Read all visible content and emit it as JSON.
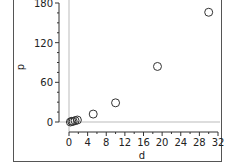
{
  "chart_data": {
    "type": "scatter",
    "title": "",
    "xlabel": "d",
    "ylabel": "p",
    "xlim": [
      0,
      32
    ],
    "ylim": [
      0,
      180
    ],
    "xticks": [
      0,
      4,
      8,
      12,
      16,
      20,
      24,
      28,
      32
    ],
    "yticks": [
      0,
      60,
      120,
      180
    ],
    "grid": false,
    "reference_lines": {
      "x": 0,
      "y": 0
    },
    "marker": "open-circle",
    "series": [
      {
        "name": "p vs d",
        "points": [
          {
            "x": 0.3,
            "y": 0
          },
          {
            "x": 0.6,
            "y": 1
          },
          {
            "x": 0.9,
            "y": 1
          },
          {
            "x": 1.3,
            "y": 2
          },
          {
            "x": 1.8,
            "y": 3
          },
          {
            "x": 5.2,
            "y": 12
          },
          {
            "x": 10,
            "y": 29
          },
          {
            "x": 19,
            "y": 84
          },
          {
            "x": 30,
            "y": 166
          }
        ]
      }
    ]
  }
}
